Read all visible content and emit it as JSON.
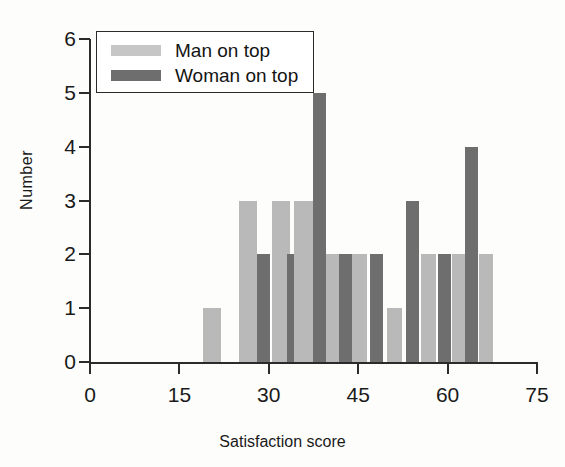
{
  "chart_data": {
    "type": "bar",
    "title": "",
    "xlabel": "Satisfaction score",
    "ylabel": "Number",
    "xlim": [
      0,
      75
    ],
    "ylim": [
      0,
      6
    ],
    "xticks": [
      "0",
      "15",
      "30",
      "45",
      "60",
      "75"
    ],
    "yticks": [
      "0",
      "1",
      "2",
      "3",
      "4",
      "5",
      "6"
    ],
    "grid": false,
    "legend_position": "top-left-inside",
    "bin_width": 3,
    "legend": [
      {
        "label": "Man on top",
        "color": "#b9b9b9"
      },
      {
        "label": "Woman on top",
        "color": "#6e6e6e"
      }
    ],
    "series": [
      {
        "name": "Man on top",
        "color": "#b9b9b9",
        "bins": [
          19,
          25,
          31,
          34,
          40,
          46,
          52,
          55,
          61
        ],
        "values": [
          1,
          3,
          3,
          3,
          2,
          1,
          2,
          2,
          2
        ]
      },
      {
        "name": "Woman on top",
        "color": "#6e6e6e",
        "bins": [
          28,
          37,
          43,
          49,
          52,
          58
        ],
        "values": [
          2,
          5,
          2,
          3,
          2,
          4
        ]
      }
    ],
    "bars": [
      {
        "series": "Man on top",
        "x": 19,
        "width": 3,
        "value": 1
      },
      {
        "series": "Man on top",
        "x": 25,
        "width": 3,
        "value": 3
      },
      {
        "series": "Woman on top",
        "x": 28,
        "width": 2.2,
        "value": 2
      },
      {
        "series": "Man on top",
        "x": 30.5,
        "width": 3,
        "value": 3
      },
      {
        "series": "Woman on top",
        "x": 33,
        "width": 1.4,
        "value": 2
      },
      {
        "series": "Man on top",
        "x": 34.3,
        "width": 3.1,
        "value": 3
      },
      {
        "series": "Woman on top",
        "x": 37.4,
        "width": 2.2,
        "value": 5
      },
      {
        "series": "Man on top",
        "x": 39.6,
        "width": 2.2,
        "value": 2
      },
      {
        "series": "Woman on top",
        "x": 41.7,
        "width": 2.3,
        "value": 2
      },
      {
        "series": "Man on top",
        "x": 44.0,
        "width": 2.5,
        "value": 2
      },
      {
        "series": "Woman on top",
        "x": 46.9,
        "width": 2.2,
        "value": 2
      },
      {
        "series": "Man on top",
        "x": 49.8,
        "width": 2.5,
        "value": 1
      },
      {
        "series": "Woman on top",
        "x": 53.0,
        "width": 2.2,
        "value": 3
      },
      {
        "series": "Man on top",
        "x": 55.6,
        "width": 2.5,
        "value": 2
      },
      {
        "series": "Woman on top",
        "x": 58.4,
        "width": 2.2,
        "value": 2
      },
      {
        "series": "Man on top",
        "x": 60.7,
        "width": 2.2,
        "value": 2
      },
      {
        "series": "Woman on top",
        "x": 62.9,
        "width": 2.2,
        "value": 4
      },
      {
        "series": "Man on top",
        "x": 65.3,
        "width": 2.3,
        "value": 2
      }
    ]
  },
  "axes": {
    "x_title": "Satisfaction score",
    "y_title": "Number"
  }
}
